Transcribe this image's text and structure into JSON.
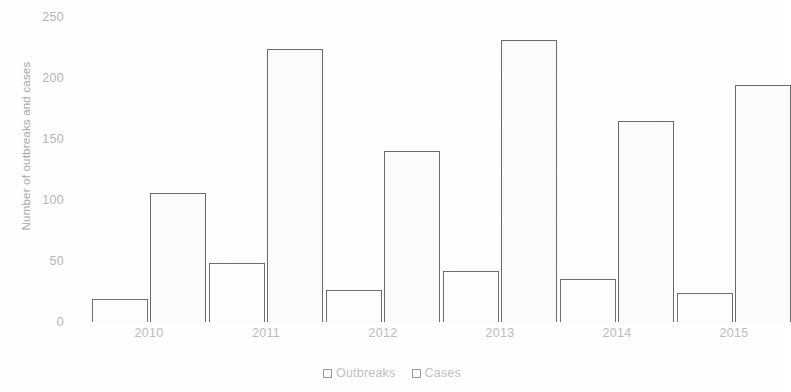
{
  "chart_data": {
    "type": "bar",
    "title": "",
    "subtitle": "",
    "xlabel": "",
    "ylabel": "Number of outbreaks and cases",
    "ylim": [
      0,
      250
    ],
    "ytick_labels": [
      "0",
      "50",
      "100",
      "150",
      "200",
      "250"
    ],
    "ytick_values": [
      0,
      50,
      100,
      150,
      200,
      250
    ],
    "grid": false,
    "legend_position": "bottom-center",
    "categories": [
      "2010",
      "2011",
      "2012",
      "2013",
      "2014",
      "2015"
    ],
    "series": [
      {
        "name": "Outbreaks",
        "values": [
          19,
          48,
          26,
          42,
          35,
          24
        ]
      },
      {
        "name": "Cases",
        "values": [
          106,
          224,
          140,
          231,
          165,
          194
        ]
      }
    ],
    "colors": {
      "bar_fill": "#fdfdfd",
      "bar_outline": "#6e6e6e",
      "axis_text": "#b4b4b4",
      "legend_text": "#c0c0c0",
      "background": "#fefefe"
    }
  },
  "legend": {
    "items": [
      {
        "label": "Outbreaks",
        "marker": "square-outline-icon"
      },
      {
        "label": "Cases",
        "marker": "square-outline-icon"
      }
    ]
  }
}
